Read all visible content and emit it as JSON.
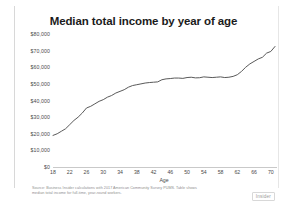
{
  "chart_data": {
    "type": "line",
    "title": "Median total income by year of age",
    "xlabel": "Age",
    "ylabel": "",
    "xlim": [
      18,
      71
    ],
    "ylim": [
      0,
      80000
    ],
    "grid": false,
    "legend": "none",
    "line_color": "#595959",
    "x_ticks": [
      "18",
      "22",
      "26",
      "30",
      "34",
      "38",
      "42",
      "46",
      "50",
      "54",
      "58",
      "62",
      "66",
      "70"
    ],
    "y_ticks": [
      "$80,000",
      "$70,000",
      "$60,000",
      "$50,000",
      "$40,000",
      "$30,000",
      "$20,000",
      "$10,000",
      "$0"
    ],
    "y_tick_values": [
      80000,
      70000,
      60000,
      50000,
      40000,
      30000,
      20000,
      10000,
      0
    ],
    "x": [
      18,
      19,
      20,
      21,
      22,
      23,
      24,
      25,
      26,
      27,
      28,
      29,
      30,
      31,
      32,
      33,
      34,
      35,
      36,
      37,
      38,
      39,
      40,
      41,
      42,
      43,
      44,
      45,
      46,
      47,
      48,
      49,
      50,
      51,
      52,
      53,
      54,
      55,
      56,
      57,
      58,
      59,
      60,
      61,
      62,
      63,
      64,
      65,
      66,
      67,
      68,
      69,
      70,
      71
    ],
    "values": [
      19000,
      20000,
      21500,
      23000,
      25500,
      28000,
      30000,
      32500,
      35500,
      36500,
      38000,
      39500,
      40500,
      42000,
      43000,
      44500,
      45500,
      46500,
      48000,
      49000,
      49500,
      50000,
      50500,
      50800,
      51000,
      51200,
      52500,
      53000,
      53200,
      53500,
      53500,
      53300,
      53800,
      54000,
      53600,
      53700,
      54200,
      54000,
      53800,
      54000,
      54200,
      53800,
      54000,
      54500,
      55500,
      57500,
      60000,
      62000,
      63500,
      65000,
      66000,
      68500,
      69500,
      72500
    ],
    "source_note_lines": [
      "Source: Business Insider calculations with 2017 American Community Survey PUMS. Table shows",
      "median total income for full-time, year-round workers."
    ],
    "brand": "Insider"
  }
}
